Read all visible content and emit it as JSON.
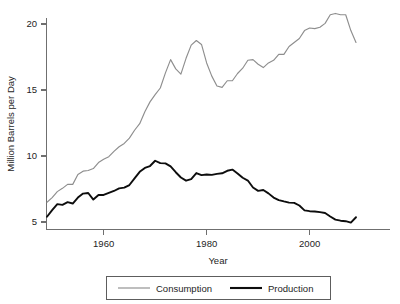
{
  "chart_data": {
    "type": "line",
    "title": "",
    "subtitle": "",
    "xlabel": "Year",
    "ylabel": "Million Barrels per Day",
    "xlim": [
      1949,
      1949
    ],
    "ylim": [
      4.4,
      21.2
    ],
    "xticks": [
      1960,
      1980,
      2000
    ],
    "xticklabels": [
      "1960",
      "1980",
      "2000"
    ],
    "yticks": [
      5,
      10,
      15,
      20
    ],
    "yticklabels": [
      "5",
      "10",
      "15",
      "20"
    ],
    "grid": false,
    "legend_position": "below-center",
    "x": [
      1949,
      1950,
      1951,
      1952,
      1953,
      1954,
      1955,
      1956,
      1957,
      1958,
      1959,
      1960,
      1961,
      1962,
      1963,
      1964,
      1965,
      1966,
      1967,
      1968,
      1969,
      1970,
      1971,
      1972,
      1973,
      1974,
      1975,
      1976,
      1977,
      1978,
      1979,
      1980,
      1981,
      1982,
      1983,
      1984,
      1985,
      1986,
      1987,
      1988,
      1989,
      1990,
      1991,
      1992,
      1993,
      1994,
      1995,
      1996,
      1997,
      1998,
      1999,
      2000,
      2001,
      2002,
      2003,
      2004,
      2005,
      2006,
      2007,
      2008,
      2009
    ],
    "series": [
      {
        "name": "Consumption",
        "color": "#8e8e8e",
        "values": [
          6.5,
          6.85,
          7.3,
          7.55,
          7.85,
          7.85,
          8.6,
          8.85,
          8.9,
          9.05,
          9.5,
          9.75,
          9.95,
          10.35,
          10.7,
          10.95,
          11.35,
          11.95,
          12.45,
          13.35,
          14.1,
          14.65,
          15.15,
          16.3,
          17.3,
          16.6,
          16.2,
          17.4,
          18.4,
          18.75,
          18.45,
          17.05,
          16.05,
          15.3,
          15.2,
          15.7,
          15.7,
          16.25,
          16.65,
          17.25,
          17.3,
          16.95,
          16.7,
          17.05,
          17.25,
          17.7,
          17.7,
          18.3,
          18.6,
          18.9,
          19.5,
          19.7,
          19.65,
          19.75,
          20.05,
          20.7,
          20.8,
          20.7,
          20.7,
          19.5,
          18.6
        ]
      },
      {
        "name": "Production",
        "color": "#0d0d0d",
        "values": [
          5.4,
          5.9,
          6.35,
          6.3,
          6.5,
          6.4,
          6.85,
          7.15,
          7.2,
          6.7,
          7.05,
          7.05,
          7.2,
          7.35,
          7.55,
          7.6,
          7.8,
          8.3,
          8.8,
          9.1,
          9.24,
          9.64,
          9.46,
          9.44,
          9.21,
          8.77,
          8.37,
          8.13,
          8.25,
          8.71,
          8.55,
          8.6,
          8.57,
          8.65,
          8.69,
          8.88,
          8.97,
          8.68,
          8.35,
          8.14,
          7.61,
          7.36,
          7.42,
          7.17,
          6.85,
          6.66,
          6.56,
          6.47,
          6.45,
          6.25,
          5.88,
          5.82,
          5.8,
          5.75,
          5.68,
          5.42,
          5.18,
          5.1,
          5.06,
          4.95,
          5.36
        ]
      }
    ],
    "legend": [
      "Consumption",
      "Production"
    ]
  },
  "legend": {
    "items": [
      {
        "label": "Consumption",
        "color": "#8e8e8e"
      },
      {
        "label": "Production",
        "color": "#0d0d0d"
      }
    ]
  },
  "axes": {
    "x_title": "Year",
    "y_title": "Million Barrels per Day"
  }
}
